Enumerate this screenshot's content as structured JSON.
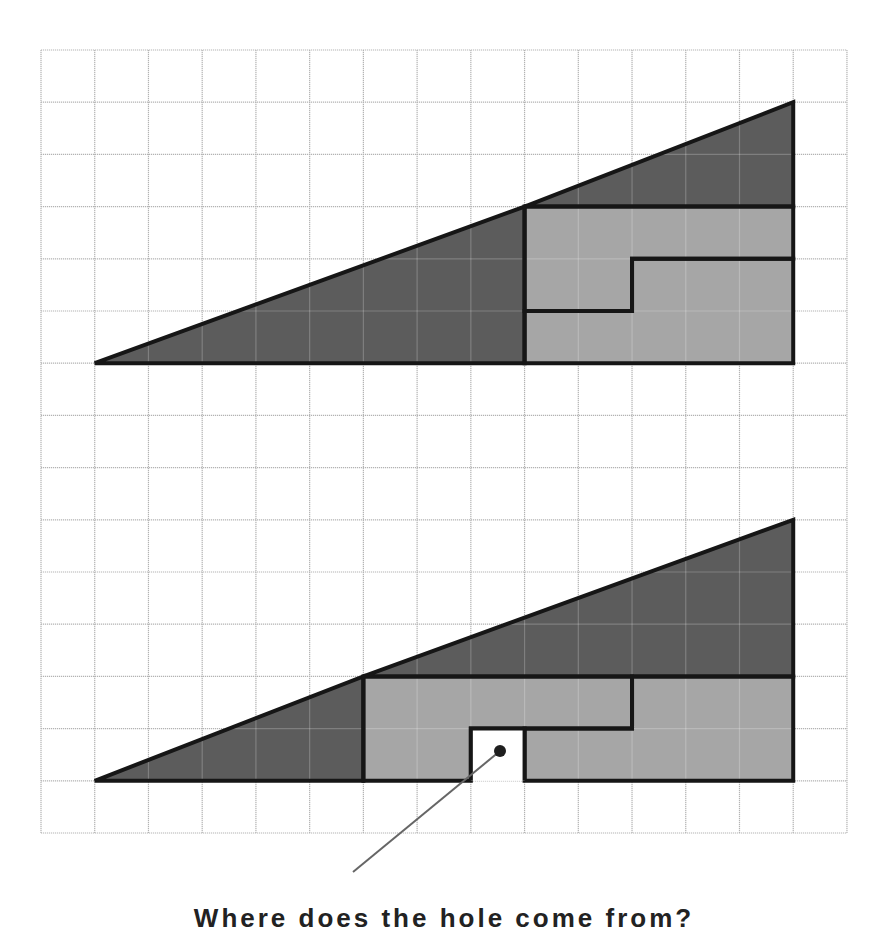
{
  "diagram": {
    "grid": {
      "origin_x": 41,
      "origin_y": 50,
      "cell_w": 53.73,
      "cell_h": 52.2,
      "cols": 15,
      "rows": 15,
      "line_color": "#b3b3b3"
    },
    "colors": {
      "dark_fill": "#5c5c5c",
      "light_fill": "#a6a6a6",
      "outline": "#161616",
      "hole_fill": "#ffffff",
      "pointer": "#666666",
      "dot": "#1e1e1e"
    },
    "figures": [
      {
        "name": "top-arrangement",
        "pieces": [
          {
            "name": "large-dark-triangle",
            "fill": "dark",
            "points": [
              [
                1,
                6
              ],
              [
                9,
                6
              ],
              [
                9,
                3
              ]
            ]
          },
          {
            "name": "small-dark-triangle",
            "fill": "dark",
            "points": [
              [
                9,
                3
              ],
              [
                14,
                1
              ],
              [
                14,
                3
              ]
            ]
          },
          {
            "name": "upper-light-l-piece",
            "fill": "light",
            "points": [
              [
                9,
                3
              ],
              [
                14,
                3
              ],
              [
                14,
                4
              ],
              [
                11,
                4
              ],
              [
                11,
                5
              ],
              [
                9,
                5
              ]
            ]
          },
          {
            "name": "lower-light-l-piece",
            "fill": "light",
            "points": [
              [
                9,
                5
              ],
              [
                11,
                5
              ],
              [
                11,
                4
              ],
              [
                14,
                4
              ],
              [
                14,
                6
              ],
              [
                9,
                6
              ]
            ]
          }
        ]
      },
      {
        "name": "bottom-arrangement",
        "pieces": [
          {
            "name": "small-dark-triangle",
            "fill": "dark",
            "points": [
              [
                1,
                14
              ],
              [
                6,
                14
              ],
              [
                6,
                12
              ]
            ]
          },
          {
            "name": "large-dark-triangle",
            "fill": "dark",
            "points": [
              [
                6,
                12
              ],
              [
                14,
                9
              ],
              [
                14,
                12
              ]
            ]
          },
          {
            "name": "upper-light-l-piece",
            "fill": "light",
            "points": [
              [
                6,
                12
              ],
              [
                11,
                12
              ],
              [
                11,
                13
              ],
              [
                8,
                13
              ],
              [
                8,
                14
              ],
              [
                6,
                14
              ]
            ]
          },
          {
            "name": "lower-light-l-piece",
            "fill": "light",
            "points": [
              [
                11,
                12
              ],
              [
                14,
                12
              ],
              [
                14,
                14
              ],
              [
                9,
                14
              ],
              [
                9,
                13
              ],
              [
                11,
                13
              ]
            ]
          }
        ],
        "hole": {
          "name": "missing-square",
          "x": 8,
          "y": 13,
          "w": 1,
          "h": 1
        }
      }
    ],
    "pointer": {
      "dot": {
        "x": 500,
        "y": 751,
        "r": 6
      },
      "line_end": {
        "x": 353,
        "y": 872
      }
    },
    "caption": "Where does the hole come from?"
  }
}
